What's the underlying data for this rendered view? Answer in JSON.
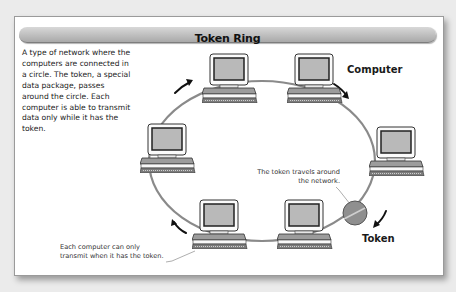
{
  "title": "Token Ring",
  "description": "A type of network where the computers are connected in a circle. The token, a special data package, passes around the circle. Each computer is able to transmit data only while it has the token.",
  "labels": {
    "computer": "Computer",
    "token": "Token"
  },
  "callouts": {
    "token_travels_line1": "The token travels around",
    "token_travels_line2": "the network.",
    "transmit_line1": "Each computer can only",
    "transmit_line2": "transmit when it has the token."
  },
  "nodes": [
    {
      "id": "top-left",
      "x": 202,
      "y": 53
    },
    {
      "id": "top-right",
      "x": 287,
      "y": 53
    },
    {
      "id": "right",
      "x": 369,
      "y": 126
    },
    {
      "id": "bottom-right",
      "x": 277,
      "y": 199
    },
    {
      "id": "bottom-left",
      "x": 192,
      "y": 199
    },
    {
      "id": "left",
      "x": 140,
      "y": 123
    }
  ],
  "colors": {
    "ring": "#8a8a8a",
    "token": "#8f8f8f",
    "screen": "#b9b9b9",
    "panel": "#ffffff",
    "background": "#ebebeb"
  }
}
